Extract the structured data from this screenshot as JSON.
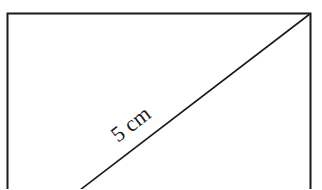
{
  "diagram": {
    "shape": "rectangle",
    "diagonal_label": "5 cm",
    "stroke_color": "#1a1a1a",
    "background": "#ffffff"
  }
}
